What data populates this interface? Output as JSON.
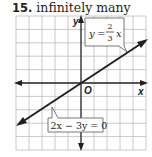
{
  "problem": {
    "number": "15.",
    "answer": "infinitely many"
  },
  "graph": {
    "axis_labels": {
      "x": "x",
      "y": "y",
      "origin": "O"
    },
    "grid": {
      "columns": 10,
      "rows": 10,
      "x_range": [
        -5,
        5
      ],
      "y_range": [
        -5,
        5
      ]
    },
    "line_color": "#231f20",
    "grid_color": "#b9b9b9",
    "equations": [
      {
        "label": "y = 2/3 x",
        "lhs": "y",
        "eq": "=",
        "num": "2",
        "den": "3",
        "var": "x"
      },
      {
        "label": "2x − 3y = 0"
      }
    ]
  }
}
